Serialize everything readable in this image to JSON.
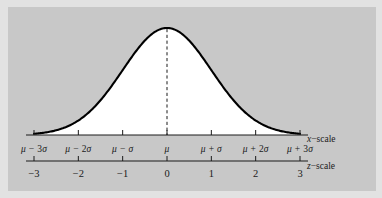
{
  "figure": {
    "background_color": "#c8c8c8",
    "outer_color": "#e2e2e2",
    "curve_fill_color": "#ffffff",
    "curve_stroke_color": "#000000",
    "axis_color": "#1a1a1a"
  },
  "chart_data": {
    "type": "line",
    "title": "",
    "subtitle": "",
    "xlabel": "",
    "ylabel": "",
    "grid": false,
    "legend": null,
    "curve": {
      "name": "normal density",
      "distribution": "normal",
      "mean_label": "μ",
      "sd_label": "σ",
      "peak_x": 0,
      "filled": true,
      "fill_color": "#ffffff",
      "stroke_color": "#000000"
    },
    "center_line": {
      "style": "dashed",
      "at_x": 0,
      "from_y": 0,
      "to_y": 1
    },
    "x_axis": {
      "name": "x-scale",
      "label": "x−scale",
      "tick_values": [
        -3,
        -2,
        -1,
        0,
        1,
        2,
        3
      ],
      "tick_labels": [
        "μ − 3σ",
        "μ − 2σ",
        "μ − σ",
        "μ",
        "μ + σ",
        "μ + 2σ",
        "μ + 3σ"
      ],
      "tick_parts": [
        {
          "sym": "μ",
          "op": "−",
          "coef": "3",
          "unit": "σ"
        },
        {
          "sym": "μ",
          "op": "−",
          "coef": "2",
          "unit": "σ"
        },
        {
          "sym": "μ",
          "op": "−",
          "coef": "",
          "unit": "σ"
        },
        {
          "sym": "μ",
          "op": "",
          "coef": "",
          "unit": ""
        },
        {
          "sym": "μ",
          "op": "+",
          "coef": "",
          "unit": "σ"
        },
        {
          "sym": "μ",
          "op": "+",
          "coef": "2",
          "unit": "σ"
        },
        {
          "sym": "μ",
          "op": "+",
          "coef": "3",
          "unit": "σ"
        }
      ],
      "range": [
        -3,
        3
      ]
    },
    "z_axis": {
      "name": "z-scale",
      "label": "z−scale",
      "tick_values": [
        -3,
        -2,
        -1,
        0,
        1,
        2,
        3
      ],
      "tick_labels": [
        "−3",
        "−2",
        "−1",
        "0",
        "1",
        "2",
        "3"
      ],
      "range": [
        -3,
        3
      ]
    }
  }
}
